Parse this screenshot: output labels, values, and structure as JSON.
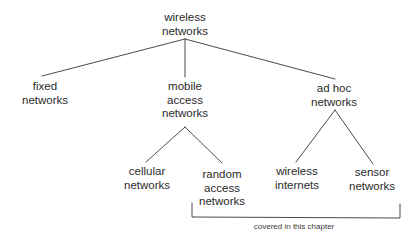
{
  "diagram": {
    "type": "tree",
    "root": {
      "id": "wireless-networks",
      "lines": [
        "wireless",
        "networks"
      ]
    },
    "level1": [
      {
        "id": "fixed-networks",
        "lines": [
          "fixed",
          "networks"
        ]
      },
      {
        "id": "mobile-access-networks",
        "lines": [
          "mobile",
          "access",
          "networks"
        ]
      },
      {
        "id": "ad-hoc-networks",
        "lines": [
          "ad hoc",
          "networks"
        ]
      }
    ],
    "level2": [
      {
        "id": "cellular-networks",
        "parent": "mobile-access-networks",
        "lines": [
          "cellular",
          "networks"
        ]
      },
      {
        "id": "random-access-networks",
        "parent": "mobile-access-networks",
        "lines": [
          "random",
          "access",
          "networks"
        ]
      },
      {
        "id": "wireless-internets",
        "parent": "ad-hoc-networks",
        "lines": [
          "wireless",
          "internets"
        ]
      },
      {
        "id": "sensor-networks",
        "parent": "ad-hoc-networks",
        "lines": [
          "sensor",
          "networks"
        ]
      }
    ],
    "bracket": {
      "spans": [
        "random-access-networks",
        "wireless-internets",
        "sensor-networks"
      ],
      "label": "covered in this chapter"
    },
    "colors": {
      "line": "#4a4a4a",
      "text": "#2b2b2b",
      "background": "#ffffff"
    }
  }
}
